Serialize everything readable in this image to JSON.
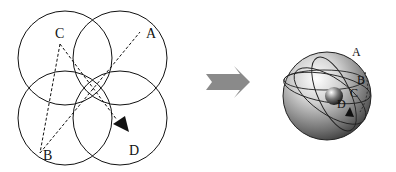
{
  "left_diagram": {
    "labels": {
      "A": "A",
      "B": "B",
      "C": "C",
      "D": "D"
    }
  },
  "right_diagram": {
    "labels": {
      "A": "A",
      "B": "B",
      "C": "C",
      "D": "D"
    }
  },
  "colors": {
    "line": "#111111",
    "arrow": "#8a8a8a"
  }
}
